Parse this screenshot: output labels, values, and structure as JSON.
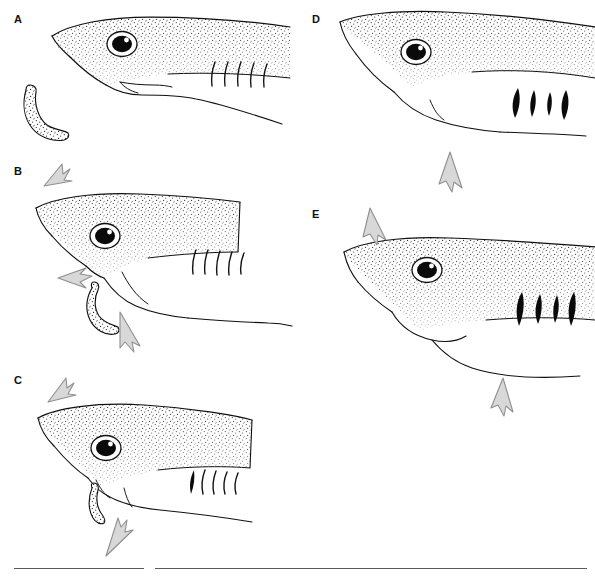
{
  "figure": {
    "type": "scientific-line-drawing",
    "background_color": "#ffffff",
    "ink_color": "#101010",
    "arrow_color": "#9a9a9a",
    "arrow_fill": "#d6d6d6",
    "stipple_color": "#1a1a1a",
    "width": 595,
    "height": 580
  },
  "panels": [
    {
      "id": "A",
      "label": "A",
      "caption_text": "",
      "stage": "approach, mouth closed, prey ahead of snout",
      "gills": "closed",
      "gill_count": 5,
      "prey_visible": true,
      "arrows": []
    },
    {
      "id": "B",
      "label": "B",
      "caption_text": "",
      "stage": "head lift, jaw protrusion, lower jaw depression, prey drawn in",
      "gills": "closed",
      "gill_count": 5,
      "prey_visible": true,
      "arrows": [
        {
          "name": "head-lift-arrow",
          "direction": "up-right"
        },
        {
          "name": "upper-jaw-protrusion-arrow",
          "direction": "left"
        },
        {
          "name": "lower-jaw-depression-arrow",
          "direction": "down-right"
        }
      ]
    },
    {
      "id": "C",
      "label": "C",
      "caption_text": "",
      "stage": "prey engulfed, mouth closing, hyoid elevation",
      "gills": "partly open",
      "gill_count": 5,
      "prey_visible": true,
      "arrows": [
        {
          "name": "head-lift-arrow",
          "direction": "up-right"
        },
        {
          "name": "hyoid-elevation-arrow",
          "direction": "up"
        }
      ]
    },
    {
      "id": "D",
      "label": "D",
      "caption_text": "",
      "stage": "mouth closed, throat expanded, gill slits open, water expelled",
      "gills": "open",
      "gill_count": 4,
      "prey_visible": false,
      "arrows": [
        {
          "name": "throat-expansion-arrow",
          "direction": "down"
        }
      ]
    },
    {
      "id": "E",
      "label": "E",
      "caption_text": "",
      "stage": "head depression, recovery, gill slits open",
      "gills": "open",
      "gill_count": 4,
      "prey_visible": false,
      "arrows": [
        {
          "name": "head-depression-arrow",
          "direction": "down-right"
        },
        {
          "name": "throat-recovery-arrow",
          "direction": "down"
        }
      ]
    }
  ],
  "rules": [
    {
      "name": "footer-rule-left",
      "x": 14,
      "y": 568,
      "width": 130
    },
    {
      "name": "footer-rule-right",
      "x": 155,
      "y": 568,
      "width": 432
    }
  ]
}
